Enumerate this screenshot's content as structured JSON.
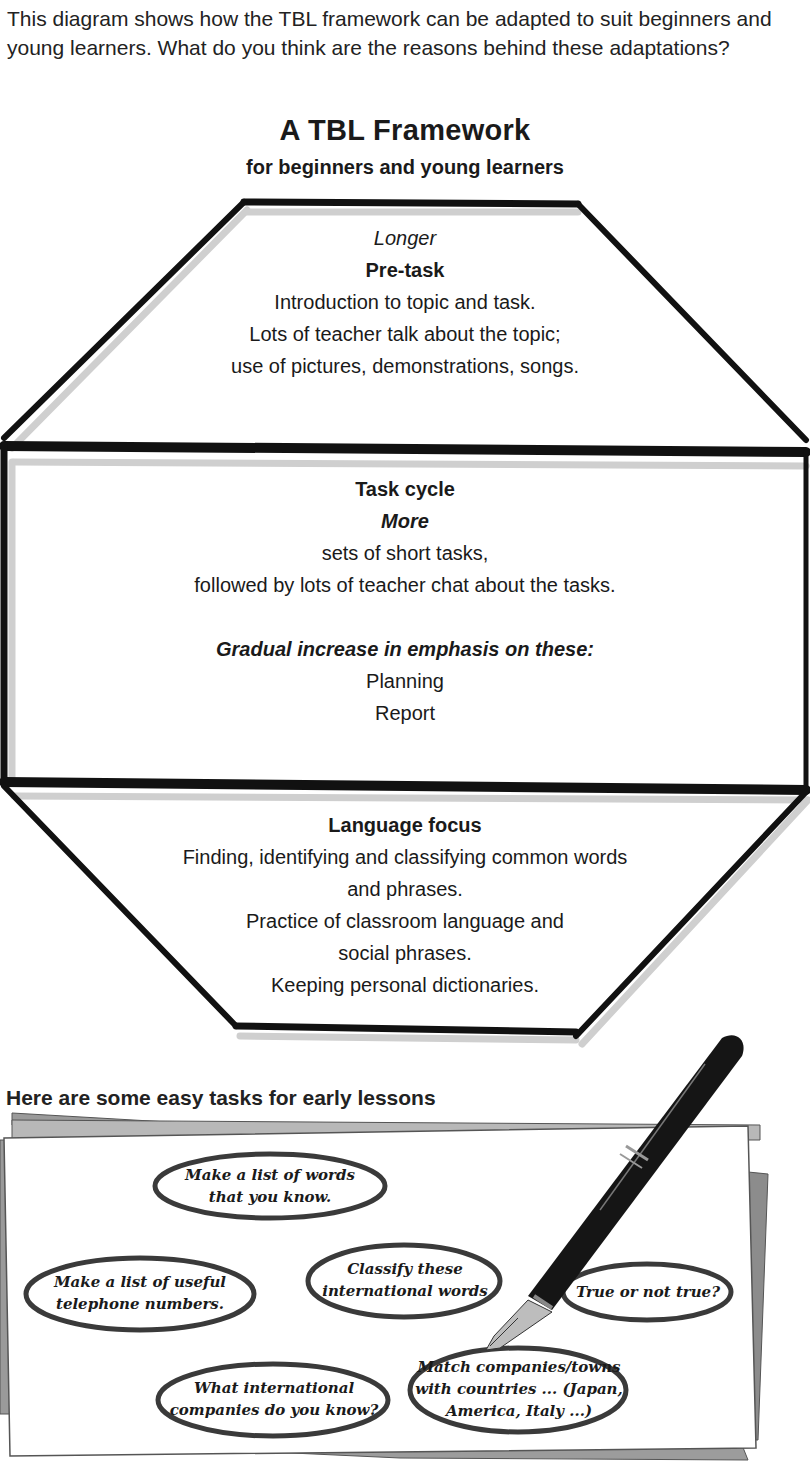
{
  "intro": "This diagram shows how the TBL framework can be adapted to suit beginners and young learners. What do you think are the reasons behind these adaptations?",
  "diagram": {
    "title": "A TBL Framework",
    "subtitle": "for beginners and young learners",
    "pretask": {
      "modifier": "Longer",
      "heading": "Pre-task",
      "lines": [
        "Introduction to topic and task.",
        "Lots of teacher talk about the topic;",
        "use of pictures, demonstrations, songs."
      ]
    },
    "task_cycle": {
      "heading": "Task cycle",
      "modifier": "More",
      "lines": [
        "sets of short tasks,",
        "followed by lots of teacher chat about the tasks."
      ],
      "emphasis_heading": "Gradual increase in emphasis on these:",
      "emphasis_items": [
        "Planning",
        "Report"
      ]
    },
    "language_focus": {
      "heading": "Language focus",
      "lines": [
        "Finding, identifying and classifying common words",
        "and phrases.",
        "Practice of classroom language and",
        "social phrases.",
        "Keeping personal dictionaries."
      ]
    }
  },
  "easy_tasks": {
    "heading": "Here are some easy tasks for early lessons",
    "bubbles": [
      {
        "line1": "Make a list of words",
        "line2": "that you know.",
        "line3": ""
      },
      {
        "line1": "Make a list of useful",
        "line2": "telephone numbers.",
        "line3": ""
      },
      {
        "line1": "Classify these",
        "line2": "international words",
        "line3": ""
      },
      {
        "line1": "True or not true?",
        "line2": "",
        "line3": ""
      },
      {
        "line1": "What international",
        "line2": "companies do you know?",
        "line3": ""
      },
      {
        "line1": "Match companies/towns",
        "line2": "with countries ... (Japan,",
        "line3": "America, Italy ...)"
      }
    ]
  },
  "colors": {
    "stroke": "#111111",
    "shadow": "#c8c8c8",
    "paper_back": "#8a8a8a",
    "paper_mid": "#b5b5b5",
    "pen": "#151515"
  }
}
